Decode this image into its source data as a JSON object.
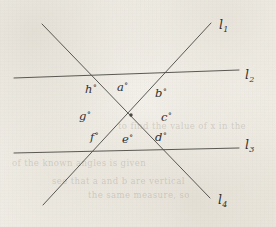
{
  "figure": {
    "background_color": "#f1eee7",
    "ink_color": "#45433f",
    "intersection_point": {
      "x": 131,
      "y": 115
    },
    "lines": [
      {
        "id": "l1",
        "label": "l",
        "subscript": "1",
        "label_position": {
          "x": 219,
          "y": 17
        },
        "from": {
          "x": 43,
          "y": 205
        },
        "to": {
          "x": 211,
          "y": 23
        }
      },
      {
        "id": "l2",
        "label": "l",
        "subscript": "2",
        "label_position": {
          "x": 245,
          "y": 67
        },
        "from": {
          "x": 14,
          "y": 78
        },
        "to": {
          "x": 239,
          "y": 70
        }
      },
      {
        "id": "l3",
        "label": "l",
        "subscript": "3",
        "label_position": {
          "x": 245,
          "y": 137
        },
        "from": {
          "x": 14,
          "y": 153
        },
        "to": {
          "x": 239,
          "y": 148
        }
      },
      {
        "id": "l4",
        "label": "l",
        "subscript": "4",
        "label_position": {
          "x": 218,
          "y": 192
        },
        "from": {
          "x": 42,
          "y": 24
        },
        "to": {
          "x": 210,
          "y": 198
        }
      }
    ],
    "angles": [
      {
        "id": "a",
        "label": "a",
        "degree_symbol": "°",
        "x": 117,
        "y": 80
      },
      {
        "id": "b",
        "label": "b",
        "degree_symbol": "°",
        "x": 155,
        "y": 86
      },
      {
        "id": "c",
        "label": "c",
        "degree_symbol": "°",
        "x": 161,
        "y": 110
      },
      {
        "id": "d",
        "label": "d",
        "degree_symbol": "°",
        "x": 155,
        "y": 130
      },
      {
        "id": "e",
        "label": "e",
        "degree_symbol": "°",
        "x": 122,
        "y": 132
      },
      {
        "id": "f",
        "label": "f",
        "degree_symbol": "°",
        "x": 90,
        "y": 130
      },
      {
        "id": "g",
        "label": "g",
        "degree_symbol": "°",
        "x": 79,
        "y": 109
      },
      {
        "id": "h",
        "label": "h",
        "degree_symbol": "°",
        "x": 85,
        "y": 82
      }
    ],
    "bleed_through": [
      {
        "text": "to find the value of x in the",
        "x": 118,
        "y": 121
      },
      {
        "text": "of the known angles is given",
        "x": 12,
        "y": 158
      },
      {
        "text": "see that a and b are vertical",
        "x": 52,
        "y": 176
      },
      {
        "text": "the same measure, so",
        "x": 88,
        "y": 190
      }
    ]
  }
}
